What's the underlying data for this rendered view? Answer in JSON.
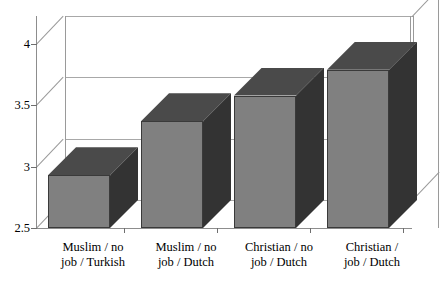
{
  "chart_data": {
    "type": "bar",
    "title": "",
    "subtitle": "",
    "xlabel": "",
    "ylabel": "",
    "categories": [
      "Muslim / no job / Turkish",
      "Muslim / no job / Dutch",
      "Christian / no job / Dutch",
      "Christian / job / Dutch"
    ],
    "category_lines": [
      [
        "Muslim / no",
        "job / Turkish"
      ],
      [
        "Muslim / no",
        "job / Dutch"
      ],
      [
        "Christian / no",
        "job / Dutch"
      ],
      [
        "Christian /",
        "job / Dutch"
      ]
    ],
    "values": [
      2.93,
      3.37,
      3.58,
      3.79
    ],
    "ylim": [
      2.5,
      4.0
    ],
    "yticks": [
      "2.5",
      "3",
      "3.5",
      "4"
    ],
    "ytick_values": [
      2.5,
      3.0,
      3.5,
      4.0
    ],
    "grid": true,
    "legend": false,
    "legend_position": "none",
    "style": "3d-column",
    "colors": {
      "bar_front": "#808080",
      "bar_side": "#333333",
      "bar_top": "#4a4a4a",
      "axis": "#8d8d8d",
      "gridline": "#a8a8a8",
      "background": "#ffffff",
      "text": "#000000"
    }
  }
}
